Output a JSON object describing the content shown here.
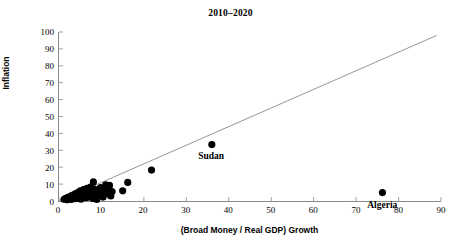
{
  "chart_data": {
    "type": "scatter",
    "title": "2010–2020",
    "xlabel": "(Broad Money / Real GDP) Growth",
    "ylabel": "Inflation",
    "xlim": [
      0,
      90
    ],
    "ylim": [
      0,
      100
    ],
    "xticks": [
      0,
      10,
      20,
      30,
      40,
      50,
      60,
      70,
      80,
      90
    ],
    "yticks": [
      0,
      10,
      20,
      30,
      40,
      50,
      60,
      70,
      80,
      90,
      100
    ],
    "grid": false,
    "legend": false,
    "marker_color": "#000000",
    "trendline": {
      "type": "line",
      "color": "#8a8a8a",
      "x": [
        0.3,
        89.0
      ],
      "y": [
        0.3,
        98.0
      ],
      "slope": 1.1,
      "intercept": 0.0
    },
    "points": [
      {
        "x": 1.2,
        "y": 1.0
      },
      {
        "x": 1.6,
        "y": 1.6
      },
      {
        "x": 1.9,
        "y": 0.7
      },
      {
        "x": 2.1,
        "y": 2.2
      },
      {
        "x": 2.4,
        "y": 1.2
      },
      {
        "x": 2.7,
        "y": 2.8
      },
      {
        "x": 2.9,
        "y": 0.9
      },
      {
        "x": 3.1,
        "y": 3.3
      },
      {
        "x": 3.3,
        "y": 1.8
      },
      {
        "x": 3.6,
        "y": 2.5
      },
      {
        "x": 3.8,
        "y": 4.2
      },
      {
        "x": 4.0,
        "y": 1.4
      },
      {
        "x": 4.2,
        "y": 3.0
      },
      {
        "x": 4.4,
        "y": 5.0
      },
      {
        "x": 4.6,
        "y": 2.1
      },
      {
        "x": 4.8,
        "y": 3.8
      },
      {
        "x": 5.0,
        "y": 6.0
      },
      {
        "x": 5.2,
        "y": 1.1
      },
      {
        "x": 5.4,
        "y": 4.5
      },
      {
        "x": 5.6,
        "y": 2.6
      },
      {
        "x": 5.8,
        "y": 6.8
      },
      {
        "x": 6.0,
        "y": 3.5
      },
      {
        "x": 6.2,
        "y": 5.4
      },
      {
        "x": 6.4,
        "y": 1.9
      },
      {
        "x": 6.6,
        "y": 7.5
      },
      {
        "x": 6.8,
        "y": 4.0
      },
      {
        "x": 7.0,
        "y": 2.4
      },
      {
        "x": 7.2,
        "y": 6.2
      },
      {
        "x": 7.4,
        "y": 8.2
      },
      {
        "x": 7.6,
        "y": 3.2
      },
      {
        "x": 7.8,
        "y": 5.0
      },
      {
        "x": 8.0,
        "y": 1.5
      },
      {
        "x": 8.1,
        "y": 11.3
      },
      {
        "x": 8.3,
        "y": 7.0
      },
      {
        "x": 8.5,
        "y": 2.9
      },
      {
        "x": 8.7,
        "y": 4.6
      },
      {
        "x": 8.9,
        "y": 0.9
      },
      {
        "x": 9.2,
        "y": 6.4
      },
      {
        "x": 9.5,
        "y": 3.6
      },
      {
        "x": 9.8,
        "y": 8.0
      },
      {
        "x": 10.1,
        "y": 5.2
      },
      {
        "x": 10.4,
        "y": 2.3
      },
      {
        "x": 10.7,
        "y": 7.2
      },
      {
        "x": 11.0,
        "y": 9.5
      },
      {
        "x": 11.3,
        "y": 4.3
      },
      {
        "x": 11.6,
        "y": 6.6
      },
      {
        "x": 11.9,
        "y": 9.2
      },
      {
        "x": 12.2,
        "y": 3.0
      },
      {
        "x": 12.5,
        "y": 5.6
      },
      {
        "x": 15.0,
        "y": 6.0
      },
      {
        "x": 16.2,
        "y": 11.0
      },
      {
        "x": 21.8,
        "y": 18.3
      },
      {
        "x": 36.0,
        "y": 33.4
      },
      {
        "x": 76.2,
        "y": 5.0
      }
    ],
    "annotations": [
      {
        "label": "Sudan",
        "x": 36.0,
        "y": 33.4
      },
      {
        "label": "Algeria",
        "x": 76.2,
        "y": 5.0
      }
    ]
  }
}
